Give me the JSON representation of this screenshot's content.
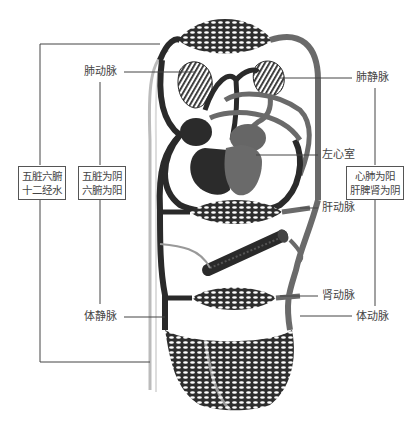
{
  "diagram": {
    "colors": {
      "vessel_dark": "#2a2a2a",
      "vessel_gray": "#707070",
      "heart_right": "#2b2b2b",
      "heart_left": "#6a6a6a",
      "leader_line": "#444444",
      "background": "#ffffff"
    },
    "labels": {
      "pulmonary_artery": "肺动脉",
      "pulmonary_vein": "肺静脉",
      "left_ventricle": "左心室",
      "hepatic_artery": "肝动脉",
      "renal_artery": "肾动脉",
      "systemic_vein": "体静脉",
      "systemic_artery": "体动脉"
    },
    "boxes": {
      "organs_meridians": {
        "line1": "五脏六腑",
        "line2": "十二经水"
      },
      "zang_fu_yin_yang": {
        "line1": "五脏为阴",
        "line2": "六腑为阳"
      },
      "heart_lung_liver": {
        "line1": "心肺为阳",
        "line2": "肝脾肾为阴"
      }
    }
  }
}
